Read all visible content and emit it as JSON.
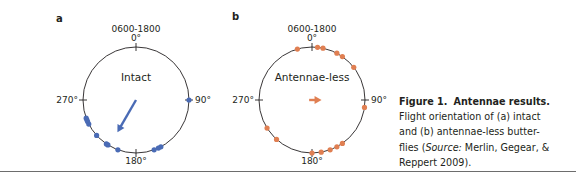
{
  "figure": {
    "caption": {
      "label": "Figure 1.",
      "title": "Antennae results.",
      "line1": "Flight orientation of (a) intact",
      "line2": "and (b) antennae-less butter-",
      "line3_pre": "flies (",
      "line3_source": "Source:",
      "line3_post": " Merlin, Gegear, &",
      "line4": "Reppert 2009)."
    }
  },
  "chart_data": [
    {
      "type": "scatter",
      "subtype": "circular",
      "panel": "a",
      "title": "Intact",
      "time_window": "0600-1800",
      "axis_labels": {
        "top": "0°",
        "right": "90°",
        "bottom": "180°",
        "left": "270°"
      },
      "color": "#4a6bb5",
      "points_deg": [
        90,
        152,
        155,
        160,
        200,
        212,
        214,
        228,
        243,
        246,
        248,
        250
      ],
      "mean_vector": {
        "direction_deg": 210,
        "length": 0.7
      }
    },
    {
      "type": "scatter",
      "subtype": "circular",
      "panel": "b",
      "title": "Antennae-less",
      "time_window": "0600-1800",
      "axis_labels": {
        "top": "0°",
        "right": "90°",
        "bottom": "180°",
        "left": "270°"
      },
      "color": "#e07f52",
      "points_deg": [
        -16,
        6,
        12,
        28,
        35,
        52,
        98,
        145,
        152,
        160,
        170,
        180,
        222,
        238
      ],
      "mean_vector": {
        "direction_deg": 90,
        "length": 0.18
      }
    }
  ]
}
